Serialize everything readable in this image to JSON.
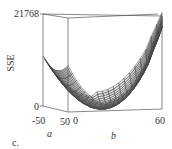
{
  "chart_data": {
    "type": "surface3d",
    "title": "",
    "panel_label": "c.",
    "zlabel": "SSE",
    "xlabel": "a",
    "ylabel": "b",
    "z_ticks": [
      "0",
      "21768"
    ],
    "a_ticks": [
      "-50",
      "50"
    ],
    "b_ticks": [
      "0",
      "60"
    ],
    "zlim": [
      0,
      21768
    ],
    "alim": [
      -50,
      50
    ],
    "blim": [
      0,
      60
    ],
    "surface_color": "#555555",
    "grid": false
  },
  "labels": {
    "zmax": "21768",
    "zmin": "0",
    "zname": "SSE",
    "a_min": "-50",
    "a_max": "50",
    "b_min": "0",
    "b_max": "60",
    "a_name": "a",
    "b_name": "b",
    "panel": "c."
  }
}
